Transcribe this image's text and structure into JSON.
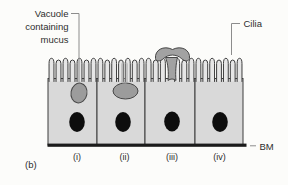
{
  "diagram": {
    "panel_label": "(b)",
    "annotations": {
      "vacuole_lines": [
        "Vacuole",
        "containing",
        "mucus"
      ],
      "cilia_label": "Cilia",
      "bm_label": "BM"
    },
    "cells": [
      {
        "label": "(i)"
      },
      {
        "label": "(ii)"
      },
      {
        "label": "(iii)"
      },
      {
        "label": "(iv)"
      }
    ]
  },
  "colors": {
    "background": "#fcfcfa",
    "cell_fill": "#d9d9d9",
    "cilia_fill": "#e6e6e6",
    "outline": "#3d3d3d",
    "vacuole_fill": "#9c9c9c",
    "vacuole_outline": "#474747",
    "mucus_fill": "#a2a2a2",
    "nucleus": "#0d0d0d",
    "bm_line": "#1b1b1b",
    "pointer_line": "#8c8c8c",
    "text": "#2d2d2d"
  }
}
